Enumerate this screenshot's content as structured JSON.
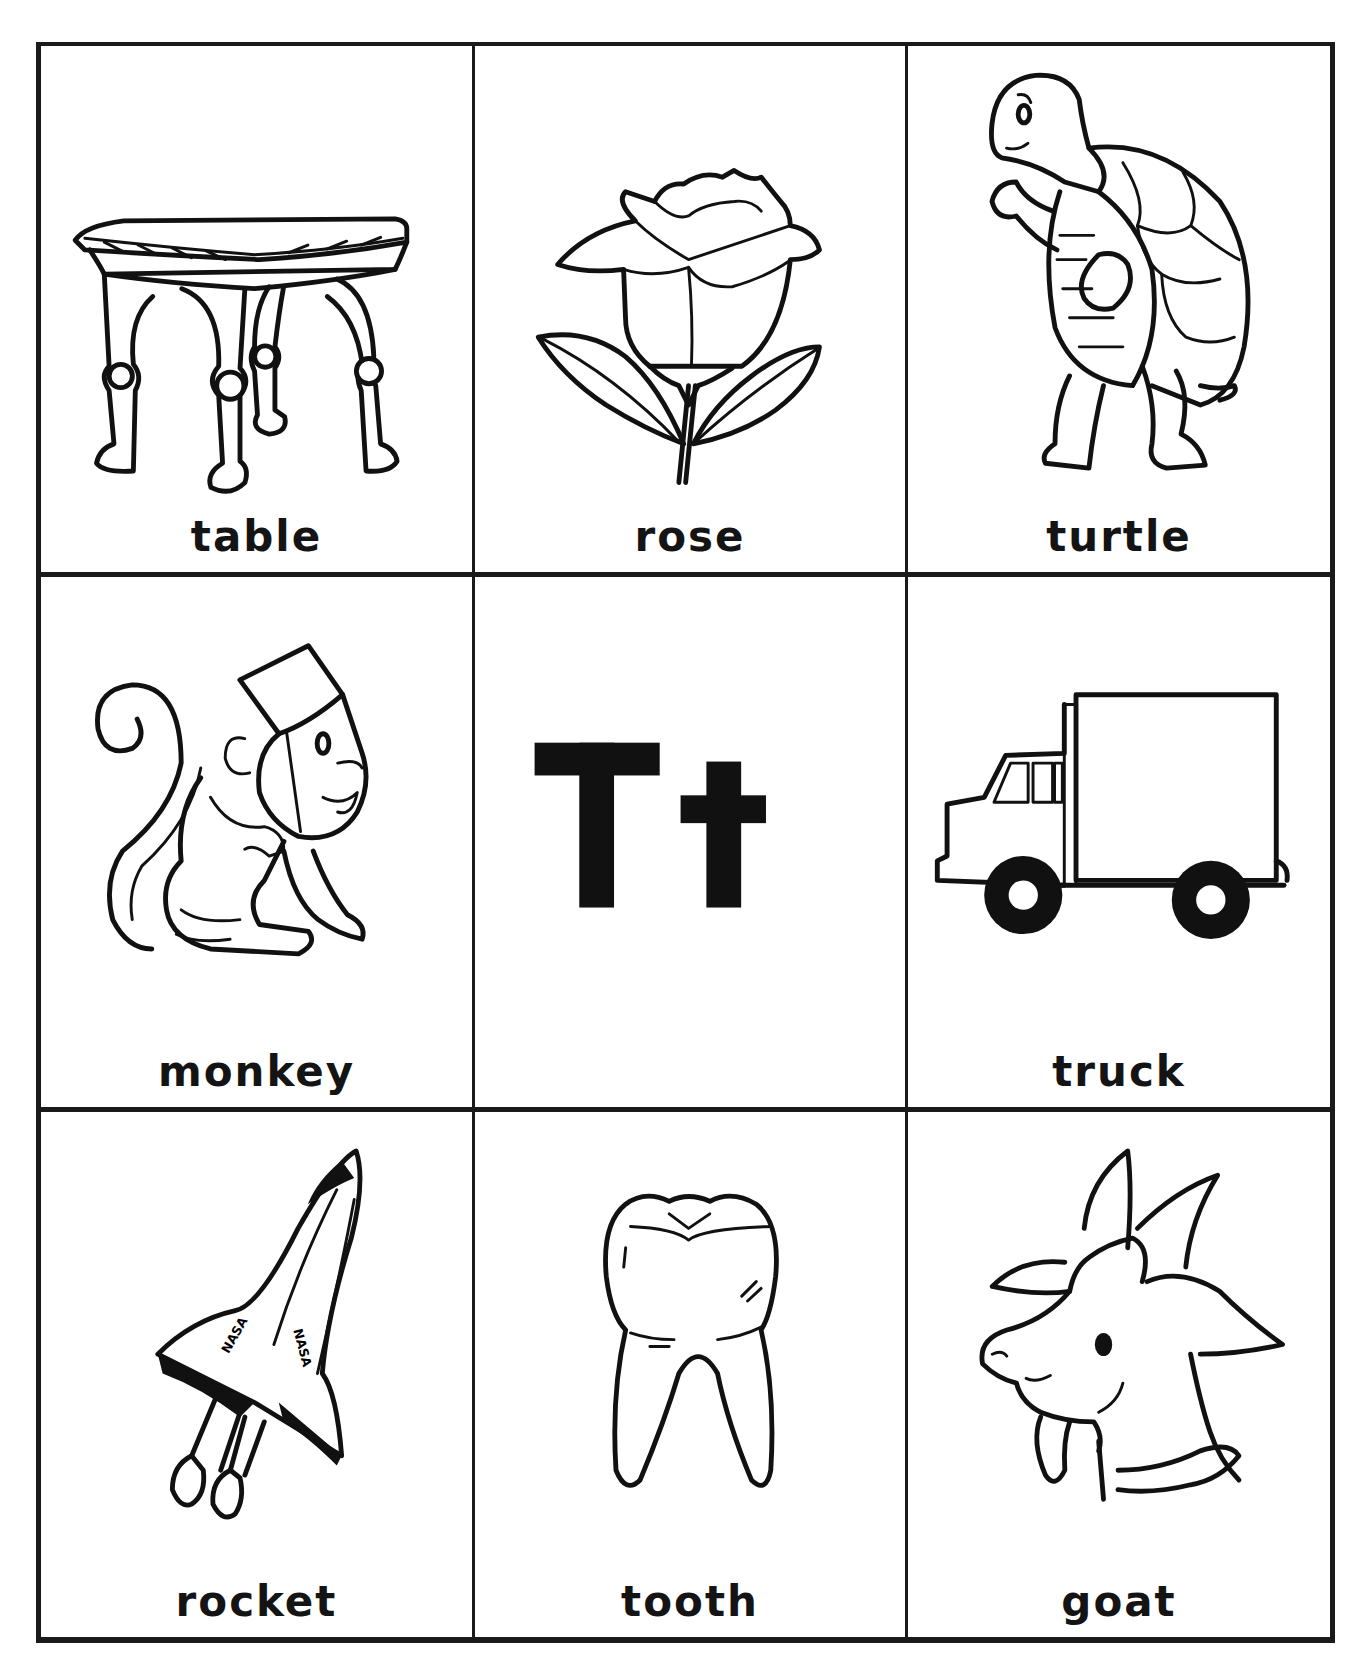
{
  "worksheet": {
    "letter": {
      "uppercase": "T",
      "lowercase": "t",
      "display": "Tt"
    },
    "cells": [
      {
        "word": "table",
        "icon": "table-icon",
        "position": "row-1-col-1"
      },
      {
        "word": "rose",
        "icon": "rose-icon",
        "position": "row-1-col-2"
      },
      {
        "word": "turtle",
        "icon": "turtle-icon",
        "position": "row-1-col-3"
      },
      {
        "word": "monkey",
        "icon": "monkey-icon",
        "position": "row-2-col-1"
      },
      {
        "word": "Tt",
        "icon": "letter-display",
        "position": "row-2-col-2"
      },
      {
        "word": "truck",
        "icon": "truck-icon",
        "position": "row-2-col-3"
      },
      {
        "word": "rocket",
        "icon": "rocket-icon",
        "position": "row-3-col-1",
        "labels": [
          "NASA",
          "NASA"
        ]
      },
      {
        "word": "tooth",
        "icon": "tooth-icon",
        "position": "row-3-col-2"
      },
      {
        "word": "goat",
        "icon": "goat-icon",
        "position": "row-3-col-3"
      }
    ],
    "colors": {
      "ink": "#111111",
      "paper": "#ffffff"
    }
  }
}
